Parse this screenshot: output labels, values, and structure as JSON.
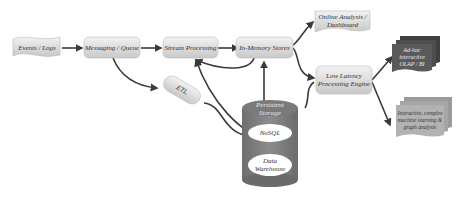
{
  "diagram": {
    "type": "data-pipeline-architecture",
    "nodes": {
      "events_logs": "Events / Logs",
      "messaging_queue": "Messaging / Queue",
      "stream_processing": "Stream Processing",
      "in_memory_stores": "In-Memory Stores",
      "online_analysis": "Online Analysis / Dashboard",
      "low_latency_engine": "Low Latency Processing Engine",
      "adhoc_olap": "Ad-hoc interactive OLAP / BI",
      "ml_graph": "Interactive, complex machine learning & graph analysis",
      "etl": "ETL",
      "persistent_storage": "Persistent Storage",
      "nosql": "NoSQL",
      "data_warehouse": "Data Warehouse"
    },
    "edges": [
      {
        "from": "Events / Logs",
        "to": "Messaging / Queue"
      },
      {
        "from": "Messaging / Queue",
        "to": "Stream Processing"
      },
      {
        "from": "Messaging / Queue",
        "to": "ETL"
      },
      {
        "from": "Stream Processing",
        "to": "In-Memory Stores"
      },
      {
        "from": "In-Memory Stores",
        "to": "Stream Processing"
      },
      {
        "from": "Persistent Storage",
        "to": "Stream Processing"
      },
      {
        "from": "In-Memory Stores",
        "to": "Persistent Storage",
        "bidirectional": true
      },
      {
        "from": "In-Memory Stores",
        "to": "Online Analysis / Dashboard"
      },
      {
        "from": "In-Memory Stores",
        "to": "Low Latency Processing Engine"
      },
      {
        "from": "Persistent Storage",
        "to": "Low Latency Processing Engine"
      },
      {
        "from": "ETL",
        "to": "Persistent Storage"
      },
      {
        "from": "Low Latency Processing Engine",
        "to": "Ad-hoc interactive OLAP / BI"
      },
      {
        "from": "Low Latency Processing Engine",
        "to": "Interactive, complex machine learning & graph analysis"
      }
    ]
  }
}
